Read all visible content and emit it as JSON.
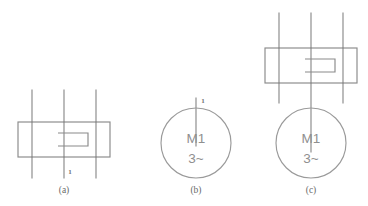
{
  "figure": {
    "background_color": "#ffffff",
    "line_color": "#8a8a8a",
    "text_color": "#8f8f8f",
    "panels": [
      {
        "caption": "(a)",
        "description": "three-pole switching device with stepped contact",
        "terminal_label": "1",
        "has_switch_block": true,
        "has_motor": false
      },
      {
        "caption": "(b)",
        "description": "three-phase motor symbol",
        "terminal_label": "1",
        "has_switch_block": false,
        "has_motor": true,
        "motor_designation": "M1",
        "motor_phase": "3~"
      },
      {
        "caption": "(c)",
        "description": "switching device connected to three-phase motor",
        "terminal_label": "",
        "has_switch_block": true,
        "has_motor": true,
        "motor_designation": "M1",
        "motor_phase": "3~"
      }
    ]
  }
}
